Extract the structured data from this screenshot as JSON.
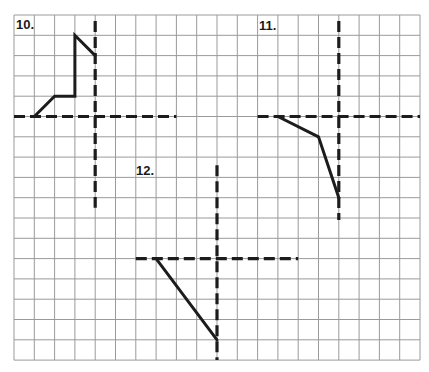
{
  "grid": {
    "x0": 14,
    "y0": 15,
    "cell": 20.3,
    "cols": 20,
    "rows": 17,
    "line_color": "#9a9a9a",
    "ink_color": "#1c1c1c"
  },
  "figures": [
    {
      "label": "10.",
      "label_pos": [
        16,
        18
      ],
      "axes": {
        "origin_cell": [
          4,
          5
        ],
        "h_range_cells": [
          0,
          8
        ],
        "v_range_cells": [
          0.3,
          9.5
        ]
      },
      "polyline_cells": [
        [
          1,
          5
        ],
        [
          2,
          4
        ],
        [
          3,
          4
        ],
        [
          3,
          1
        ],
        [
          4,
          2
        ]
      ]
    },
    {
      "label": "11.",
      "label_pos": [
        259,
        19
      ],
      "axes": {
        "origin_cell": [
          16,
          5
        ],
        "h_range_cells": [
          12,
          20
        ],
        "v_range_cells": [
          0.3,
          10.1
        ]
      },
      "polyline_cells": [
        [
          13,
          5
        ],
        [
          15,
          6
        ],
        [
          16,
          9
        ]
      ]
    },
    {
      "label": "12.",
      "label_pos": [
        136,
        164
      ],
      "axes": {
        "origin_cell": [
          10,
          12
        ],
        "h_range_cells": [
          6,
          14
        ],
        "v_range_cells": [
          7.4,
          17
        ]
      },
      "polyline_cells": [
        [
          7,
          12
        ],
        [
          10,
          16
        ]
      ]
    }
  ]
}
